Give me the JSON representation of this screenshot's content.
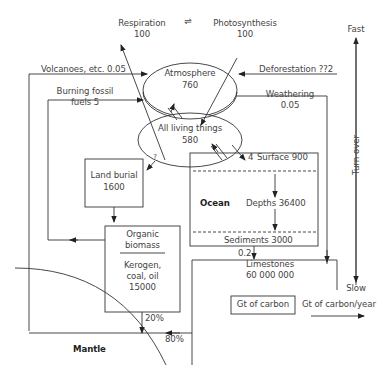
{
  "diagram": {
    "nodes": {
      "atmosphere": {
        "label": "Atmosphere",
        "value": "760"
      },
      "living": {
        "label": "All living things",
        "value": "580"
      },
      "land_burial": {
        "label": "Land burial",
        "value": "1600"
      },
      "organic": {
        "label1": "Organic",
        "label2": "biomass",
        "sub1": "Kerogen,",
        "sub2": "coal, oil",
        "value": "15000"
      },
      "ocean": {
        "label": "Ocean",
        "surface": "Surface 900",
        "depths": "Depths 36400",
        "sediments": "Sediments 3000"
      },
      "limestones": {
        "label": "Limestones",
        "value": "60 000 000"
      },
      "mantle": {
        "label": "Mantle"
      }
    },
    "flows": {
      "respiration": {
        "label": "Respiration",
        "value": "100"
      },
      "photosynthesis": {
        "label": "Photosynthesis",
        "value": "100"
      },
      "equilibrium_symbol": "⇌",
      "volcanoes": "Volcanoes, etc. 0.05",
      "fossil1": "Burning fossil",
      "fossil2": "fuels 5",
      "deforestation": "Deforestation ??2",
      "weathering1": "Weathering",
      "weathering2": "0.05",
      "land_burial_rate": "?",
      "ocean_exchange": "4",
      "sediment_rate": "0.2",
      "subduction_20": "20%",
      "subduction_80": "80%"
    },
    "scale": {
      "fast": "Fast",
      "slow": "Slow",
      "axis": "Turn over"
    },
    "legend": {
      "stock": "Gt of carbon",
      "flux": "Gt of carbon/year"
    }
  }
}
